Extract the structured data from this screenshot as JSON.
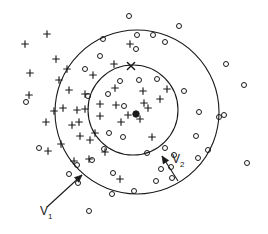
{
  "figure": {
    "background": "#ffffff",
    "stroke_color": "#1a1a1a",
    "width": 268,
    "height": 234
  },
  "labels": {
    "v1": {
      "text": "V",
      "sub": "1",
      "x": 40,
      "y": 215
    },
    "v2": {
      "text": "V",
      "sub": "2",
      "x": 172,
      "y": 163
    }
  },
  "chart_data": {
    "type": "scatter",
    "title": "",
    "xlabel": "",
    "ylabel": "",
    "grid": false,
    "legend": "none",
    "xlim": [
      0,
      268
    ],
    "ylim": [
      0,
      234
    ],
    "center": {
      "x": 136,
      "y": 113
    },
    "circles": [
      {
        "name": "outer-circle",
        "label": "V1",
        "cx": 137,
        "cy": 112,
        "r": 82
      },
      {
        "name": "inner-circle",
        "label": "V2",
        "cx": 133,
        "cy": 110,
        "r": 45
      }
    ],
    "leaders": [
      {
        "name": "v1-leader",
        "x1": 47,
        "y1": 207,
        "x2": 82,
        "y2": 175
      },
      {
        "name": "v2-leader",
        "x1": 178,
        "y1": 181,
        "x2": 162,
        "y2": 156
      }
    ],
    "center_point": {
      "x": 136,
      "y": 114,
      "marker": "filled-dot"
    },
    "series": [
      {
        "name": "cross-points",
        "marker": "cross",
        "points": [
          [
            30,
            73
          ],
          [
            29,
            95
          ],
          [
            25,
            44
          ],
          [
            47,
            34
          ],
          [
            56,
            59
          ],
          [
            63,
            108
          ],
          [
            79,
            122
          ],
          [
            59,
            80
          ],
          [
            69,
            90
          ],
          [
            85,
            94
          ],
          [
            72,
            125
          ],
          [
            46,
            122
          ],
          [
            61,
            144
          ],
          [
            80,
            136
          ],
          [
            90,
            140
          ],
          [
            89,
            159
          ],
          [
            120,
            179
          ],
          [
            85,
            109
          ],
          [
            93,
            75
          ],
          [
            100,
            104
          ],
          [
            115,
            88
          ],
          [
            121,
            122
          ],
          [
            128,
            115
          ],
          [
            140,
            119
          ],
          [
            116,
            105
          ],
          [
            144,
            103
          ],
          [
            148,
            108
          ],
          [
            152,
            137
          ],
          [
            160,
            99
          ],
          [
            167,
            89
          ],
          [
            130,
            44
          ],
          [
            114,
            64
          ],
          [
            95,
            133
          ],
          [
            105,
            152
          ],
          [
            74,
            161
          ],
          [
            77,
            110
          ],
          [
            100,
            116
          ],
          [
            143,
            91
          ],
          [
            54,
            111
          ],
          [
            67,
            69
          ],
          [
            48,
            151
          ]
        ]
      },
      {
        "name": "circle-points",
        "marker": "open-circle",
        "points": [
          [
            129,
            16
          ],
          [
            179,
            26
          ],
          [
            103,
            39
          ],
          [
            137,
            35
          ],
          [
            153,
            35
          ],
          [
            165,
            42
          ],
          [
            85,
            69
          ],
          [
            100,
            56
          ],
          [
            136,
            49
          ],
          [
            120,
            81
          ],
          [
            139,
            80
          ],
          [
            157,
            79
          ],
          [
            108,
            94
          ],
          [
            124,
            106
          ],
          [
            109,
            133
          ],
          [
            123,
            137
          ],
          [
            147,
            153
          ],
          [
            92,
            160
          ],
          [
            104,
            149
          ],
          [
            113,
            173
          ],
          [
            134,
            191
          ],
          [
            112,
            194
          ],
          [
            156,
            181
          ],
          [
            171,
            167
          ],
          [
            165,
            148
          ],
          [
            196,
            136
          ],
          [
            199,
            112
          ],
          [
            184,
            91
          ],
          [
            226,
            64
          ],
          [
            244,
            85
          ],
          [
            224,
            115
          ],
          [
            219,
            117
          ],
          [
            247,
            163
          ],
          [
            78,
            183
          ],
          [
            89,
            211
          ],
          [
            39,
            148
          ],
          [
            26,
            102
          ],
          [
            69,
            174
          ],
          [
            77,
            165
          ],
          [
            198,
            158
          ],
          [
            208,
            150
          ],
          [
            172,
            178
          ],
          [
            174,
            155
          ],
          [
            161,
            169
          ],
          [
            88,
            96
          ]
        ]
      },
      {
        "name": "x-point-on-inner-circle",
        "marker": "x",
        "points": [
          [
            131,
            66
          ]
        ]
      }
    ]
  }
}
